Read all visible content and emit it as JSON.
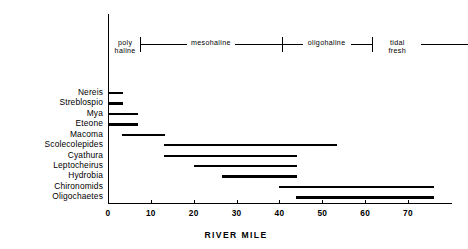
{
  "chart_data": {
    "type": "bar",
    "orientation": "horizontal",
    "title": "",
    "xlabel": "RIVER MILE",
    "ylabel": "",
    "xlim": [
      -2,
      84
    ],
    "xticks": [
      0,
      10,
      20,
      30,
      40,
      50,
      60,
      70
    ],
    "xtick_labels": [
      "0",
      "10",
      "20",
      "30",
      "40",
      "50",
      "60",
      "70"
    ],
    "grid": false,
    "legend": "none",
    "categories": [
      "Nereis",
      "Streblospio",
      "Mya",
      "Eteone",
      "Macoma",
      "Scolecolepides",
      "Cyathura",
      "Leptocheirus",
      "Hydrobia",
      "Chironomids",
      "Oligochaetes"
    ],
    "ranges": [
      {
        "species": "Nereis",
        "start": 0.0,
        "end": 3.5
      },
      {
        "species": "Streblospio",
        "start": 0.0,
        "end": 3.5
      },
      {
        "species": "Mya",
        "start": 0.0,
        "end": 7.0
      },
      {
        "species": "Eteone",
        "start": 0.0,
        "end": 7.0
      },
      {
        "species": "Macoma",
        "start": 3.3,
        "end": 13.3
      },
      {
        "species": "Scolecolepides",
        "start": 13.0,
        "end": 53.4
      },
      {
        "species": "Cyathura",
        "start": 13.0,
        "end": 44.2
      },
      {
        "species": "Leptocheirus",
        "start": 20.0,
        "end": 44.2
      },
      {
        "species": "Hydrobia",
        "start": 26.5,
        "end": 44.2
      },
      {
        "species": "Chironomids",
        "start": 40.0,
        "end": 76.0
      },
      {
        "species": "Oligochaetes",
        "start": 43.8,
        "end": 76.0
      }
    ],
    "salinity_zones": [
      {
        "name": "poly\nhaline",
        "start": 0.0,
        "end": 7.5,
        "label_at": 4.0
      },
      {
        "name": "mesohaline",
        "start": 7.5,
        "end": 40.5,
        "label_at": 24.0
      },
      {
        "name": "oligohaline",
        "start": 40.5,
        "end": 61.5,
        "label_at": 51.0
      },
      {
        "name": "tidal\nfresh",
        "start": 61.5,
        "end": 84.0,
        "label_at": 67.5
      }
    ],
    "zone_dividers": [
      7.5,
      40.5,
      61.5
    ]
  },
  "axis": {
    "x_title": "RIVER MILE",
    "tick_0": "0",
    "tick_10": "10",
    "tick_20": "20",
    "tick_30": "30",
    "tick_40": "40",
    "tick_50": "50",
    "tick_60": "60",
    "tick_70": "70"
  },
  "zones": {
    "polyhaline": "poly\nhaline",
    "mesohaline": "mesohaline",
    "oligohaline": "oligohaline",
    "tidal_fresh": "tidal\nfresh"
  },
  "species": {
    "s0": "Nereis",
    "s1": "Streblospio",
    "s2": "Mya",
    "s3": "Eteone",
    "s4": "Macoma",
    "s5": "Scolecolepides",
    "s6": "Cyathura",
    "s7": "Leptocheirus",
    "s8": "Hydrobia",
    "s9": "Chironomids",
    "s10": "Oligochaetes"
  },
  "colors": {
    "ink": "#000000",
    "paper": "#ffffff"
  }
}
